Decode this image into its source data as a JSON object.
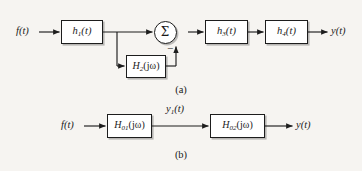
{
  "figure": {
    "type": "block-diagram",
    "background_color": "#f6f4f1",
    "line_color": "#1d1d1d",
    "block_fill": "#ffffff",
    "panels": [
      {
        "id": "a",
        "caption": "(a)",
        "description": "Feedback system: f(t) into h1(t), forward path to summing junction, feedback through H2(jw) subtracted, then h3(t) and h4(t) to y(t)",
        "input_label": "f(t)",
        "output_label": "y(t)",
        "sum_symbol": "Σ",
        "sum_sign": "−",
        "blocks": [
          {
            "name": "h1",
            "base": "h",
            "sub": "1",
            "arg": "(t)"
          },
          {
            "name": "h2",
            "base": "H",
            "sub": "2",
            "arg": "(jω)"
          },
          {
            "name": "h3",
            "base": "h",
            "sub": "3",
            "arg": "(t)"
          },
          {
            "name": "h4",
            "base": "h",
            "sub": "4",
            "arg": "(t)"
          }
        ]
      },
      {
        "id": "b",
        "caption": "(b)",
        "description": "Cascade of two frequency-response blocks: f(t) into H01(jw), intermediate y1(t), into H02(jw), output y(t)",
        "input_label": "f(t)",
        "intermediate_label": "y₁(t)",
        "output_label": "y(t)",
        "blocks": [
          {
            "name": "h01",
            "base": "H",
            "sub": "01",
            "arg": "(jω)"
          },
          {
            "name": "h02",
            "base": "H",
            "sub": "02",
            "arg": "(jω)"
          }
        ]
      }
    ]
  },
  "panel_a": {
    "input": "f(t)",
    "output": "y(t)",
    "sum": "Σ",
    "minus": "−",
    "caption": "(a)",
    "h1_base": "h",
    "h1_sub": "1",
    "h1_arg": "(t)",
    "h2_base": "H",
    "h2_sub": "2",
    "h2_arg": "(jω)",
    "h3_base": "h",
    "h3_sub": "3",
    "h3_arg": "(t)",
    "h4_base": "h",
    "h4_sub": "4",
    "h4_arg": "(t)"
  },
  "panel_b": {
    "input": "f(t)",
    "mid_base": "y",
    "mid_sub": "1",
    "mid_arg": "(t)",
    "output": "y(t)",
    "caption": "(b)",
    "h01_base": "H",
    "h01_sub": "01",
    "h01_arg": "(jω)",
    "h02_base": "H",
    "h02_sub": "02",
    "h02_arg": "(jω)"
  }
}
